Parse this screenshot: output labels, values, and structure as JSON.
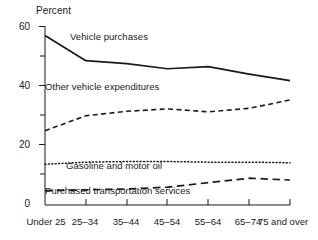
{
  "chart_data": {
    "type": "line",
    "title": "",
    "subtitle": "",
    "xlabel": "",
    "ylabel": "Percent",
    "ylim": [
      0,
      60
    ],
    "yticks": [
      0,
      20,
      40,
      60
    ],
    "yticks_minor": [
      10,
      30,
      50
    ],
    "ytick_labels": [
      "0",
      "20",
      "40",
      "60"
    ],
    "grid": false,
    "legend_position": "inline-annotations",
    "categories": [
      "Under 25",
      "25–34",
      "35–44",
      "45–54",
      "55–64",
      "65–74",
      "75 and over"
    ],
    "series": [
      {
        "name": "Vehicle purchases",
        "style": "solid",
        "color": "#1a1a1a",
        "values": [
          57.0,
          48.5,
          47.5,
          45.8,
          46.5,
          44.0,
          41.8
        ]
      },
      {
        "name": "Other vehicle expenditures",
        "style": "dashed",
        "color": "#1a1a1a",
        "values": [
          25.0,
          30.0,
          31.5,
          32.3,
          31.3,
          32.5,
          35.3
        ]
      },
      {
        "name": "Gasoline and motor oil",
        "style": "dotted",
        "color": "#1a1a1a",
        "values": [
          13.7,
          14.4,
          14.6,
          14.6,
          14.4,
          14.4,
          14.2
        ]
      },
      {
        "name": "Purchased transportation services",
        "style": "long-dashed",
        "color": "#1a1a1a",
        "values": [
          4.8,
          5.1,
          5.4,
          6.0,
          7.5,
          9.0,
          8.4
        ]
      }
    ],
    "annotations": [
      {
        "text": "Vehicle purchases",
        "x": 70,
        "y": 38
      },
      {
        "text": "Other vehicle expenditures",
        "x": 45,
        "y": 87
      },
      {
        "text": "Gasoline and motor oil",
        "x": 66,
        "y": 166
      },
      {
        "text": "Purchased transportation services",
        "x": 45,
        "y": 191
      }
    ]
  }
}
